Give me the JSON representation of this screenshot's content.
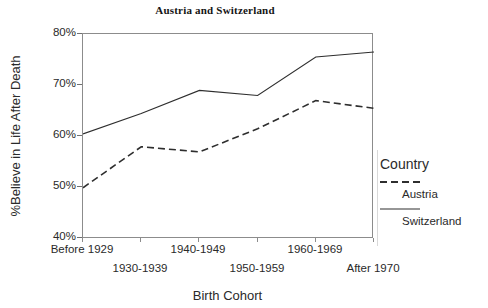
{
  "chart_data": {
    "type": "line",
    "title": "Austria and Switzerland",
    "xlabel": "Birth Cohort",
    "ylabel": "%Believe in Life After Death",
    "categories": [
      "Before 1929",
      "1930-1939",
      "1940-1949",
      "1950-1959",
      "1960-1969",
      "After 1970"
    ],
    "series": [
      {
        "name": "Austria",
        "style": "dashed",
        "values": [
          50.0,
          58.0,
          57.0,
          61.5,
          67.0,
          65.5
        ]
      },
      {
        "name": "Switzerland",
        "style": "solid",
        "values": [
          60.5,
          64.5,
          69.0,
          68.0,
          75.5,
          76.5
        ]
      }
    ],
    "ylim": [
      40,
      80
    ],
    "ytick_labels": [
      "80%",
      "70%",
      "60%",
      "50%",
      "40%"
    ],
    "ytick_values": [
      80,
      70,
      60,
      50,
      40
    ],
    "grid": false,
    "legend_position": "right",
    "legend_title": "Country",
    "line_color": "#2e2e2e"
  },
  "legend": {
    "title": "Country",
    "entries": [
      {
        "label": "Austria",
        "style": "dashed"
      },
      {
        "label": "Switzerland",
        "style": "solid"
      }
    ]
  }
}
